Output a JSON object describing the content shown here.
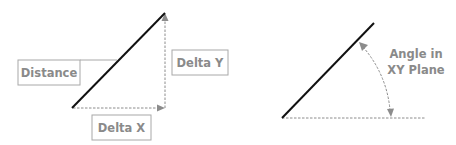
{
  "diagram": {
    "left": {
      "labels": {
        "distance": "Distance",
        "delta_y": "Delta Y",
        "delta_x": "Delta X"
      }
    },
    "right": {
      "labels": {
        "angle_line1": "Angle in",
        "angle_line2": "XY Plane"
      }
    }
  },
  "colors": {
    "line": "#111111",
    "dashed": "#8c8c8c",
    "label_text": "#8a8a8a",
    "box_border": "#a8a8a8",
    "background": "#ffffff"
  }
}
